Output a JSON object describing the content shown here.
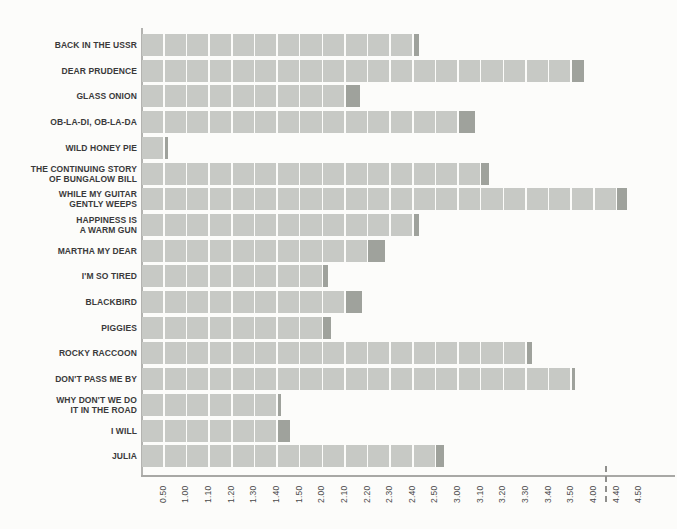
{
  "colors": {
    "background": "#fcfcfa",
    "block_light": "#c7c9c5",
    "block_dark": "#9fa29c",
    "axis": "#a8a8a5",
    "break_dash": "#8f8f8c",
    "label_text": "#3a3a3a"
  },
  "chart_data": {
    "type": "bar",
    "orientation": "horizontal",
    "unit_note": "x axis is song length in minutes.seconds; each block = 10 seconds; axis begins near 0.40 and has a dashed break between 4.00 and 4.40; final partial block of each bar is dark",
    "x_tick_labels": [
      "0.50",
      "1.00",
      "1.10",
      "1.20",
      "1.30",
      "1.40",
      "1.50",
      "2.00",
      "2.10",
      "2.20",
      "2.30",
      "2.40",
      "2.50",
      "3.00",
      "3.10",
      "3.20",
      "3.30",
      "3.40",
      "3.50",
      "4.00",
      "4.40",
      "4.50"
    ],
    "axis_break_between": [
      "4.00",
      "4.40"
    ],
    "grid": false,
    "legend": false,
    "songs": [
      {
        "label_lines": [
          "BACK IN THE USSR"
        ],
        "duration": "2.43",
        "seconds": 163
      },
      {
        "label_lines": [
          "DEAR PRUDENCE"
        ],
        "duration": "3.56",
        "seconds": 236
      },
      {
        "label_lines": [
          "GLASS ONION"
        ],
        "duration": "2.17",
        "seconds": 137
      },
      {
        "label_lines": [
          "OB-LA-DI, OB-LA-DA"
        ],
        "duration": "3.08",
        "seconds": 188
      },
      {
        "label_lines": [
          "WILD HONEY PIE"
        ],
        "duration": "0.52",
        "seconds": 52
      },
      {
        "label_lines": [
          "THE CONTINUING STORY",
          "OF BUNGALOW BILL"
        ],
        "duration": "3.14",
        "seconds": 194
      },
      {
        "label_lines": [
          "WHILE MY GUITAR",
          "GENTLY WEEPS"
        ],
        "duration": "4.45",
        "seconds": 285
      },
      {
        "label_lines": [
          "HAPPINESS IS",
          "A WARM GUN"
        ],
        "duration": "2.43",
        "seconds": 163
      },
      {
        "label_lines": [
          "MARTHA MY DEAR"
        ],
        "duration": "2.28",
        "seconds": 148
      },
      {
        "label_lines": [
          "I'M SO TIRED"
        ],
        "duration": "2.03",
        "seconds": 123
      },
      {
        "label_lines": [
          "BLACKBIRD"
        ],
        "duration": "2.18",
        "seconds": 138
      },
      {
        "label_lines": [
          "PIGGIES"
        ],
        "duration": "2.04",
        "seconds": 124
      },
      {
        "label_lines": [
          "ROCKY RACCOON"
        ],
        "duration": "3.33",
        "seconds": 213
      },
      {
        "label_lines": [
          "DON'T PASS ME BY"
        ],
        "duration": "3.51",
        "seconds": 231
      },
      {
        "label_lines": [
          "WHY DON'T WE DO",
          "IT IN THE ROAD"
        ],
        "duration": "1.41",
        "seconds": 101
      },
      {
        "label_lines": [
          "I WILL"
        ],
        "duration": "1.46",
        "seconds": 106
      },
      {
        "label_lines": [
          "JULIA"
        ],
        "duration": "2.54",
        "seconds": 174
      }
    ]
  }
}
